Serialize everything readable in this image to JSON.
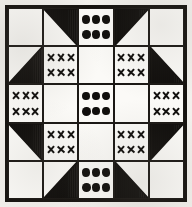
{
  "figure": {
    "kind": "quilt-block-diagram",
    "title": "",
    "grid_rows": 5,
    "grid_cols": 5,
    "colors": {
      "ink": "#100e0c",
      "paper": "#fbfaf7",
      "frame": "#15120f",
      "background": "#f2f0ec"
    },
    "motif_counts": {
      "dots_per_cell": 6,
      "crosses_per_cell": 6,
      "dot_grid": "3x2",
      "cross_grid": "3x2"
    },
    "legend": {
      "plain": "plain / unprinted patch",
      "hatched": "striped (vertical-line) triangle patch",
      "dots": "dotted print patch",
      "crosses": "cross / X print patch"
    },
    "cells": [
      {
        "row": 1,
        "col": 1,
        "type": "plain",
        "name": "corner-top-left",
        "count": 0,
        "corner": ""
      },
      {
        "row": 1,
        "col": 2,
        "type": "hatched",
        "name": "star-point-top-left",
        "count": 0,
        "corner": "bottom-right"
      },
      {
        "row": 1,
        "col": 3,
        "type": "dots",
        "name": "dot-patch-top-center",
        "count": 6,
        "corner": ""
      },
      {
        "row": 1,
        "col": 4,
        "type": "hatched",
        "name": "star-point-top-right",
        "count": 0,
        "corner": "bottom-left"
      },
      {
        "row": 1,
        "col": 5,
        "type": "plain",
        "name": "corner-top-right",
        "count": 0,
        "corner": ""
      },
      {
        "row": 2,
        "col": 1,
        "type": "hatched",
        "name": "star-point-left-top",
        "count": 0,
        "corner": "top-right"
      },
      {
        "row": 2,
        "col": 2,
        "type": "crosses",
        "name": "cross-patch-upper-left",
        "count": 6,
        "corner": ""
      },
      {
        "row": 2,
        "col": 3,
        "type": "plain",
        "name": "plain-top-center-inner",
        "count": 0,
        "corner": ""
      },
      {
        "row": 2,
        "col": 4,
        "type": "crosses",
        "name": "cross-patch-upper-right",
        "count": 6,
        "corner": ""
      },
      {
        "row": 2,
        "col": 5,
        "type": "hatched",
        "name": "star-point-right-top",
        "count": 0,
        "corner": "top-left"
      },
      {
        "row": 3,
        "col": 1,
        "type": "crosses",
        "name": "cross-patch-mid-left",
        "count": 6,
        "corner": ""
      },
      {
        "row": 3,
        "col": 2,
        "type": "plain",
        "name": "plain-mid-left-inner",
        "count": 0,
        "corner": ""
      },
      {
        "row": 3,
        "col": 3,
        "type": "dots",
        "name": "dot-patch-center",
        "count": 6,
        "corner": ""
      },
      {
        "row": 3,
        "col": 4,
        "type": "plain",
        "name": "plain-mid-right-inner",
        "count": 0,
        "corner": ""
      },
      {
        "row": 3,
        "col": 5,
        "type": "crosses",
        "name": "cross-patch-mid-right",
        "count": 6,
        "corner": ""
      },
      {
        "row": 4,
        "col": 1,
        "type": "hatched",
        "name": "star-point-left-bottom",
        "count": 0,
        "corner": "bottom-right"
      },
      {
        "row": 4,
        "col": 2,
        "type": "crosses",
        "name": "cross-patch-lower-left",
        "count": 6,
        "corner": ""
      },
      {
        "row": 4,
        "col": 3,
        "type": "plain",
        "name": "plain-bottom-center-inner",
        "count": 0,
        "corner": ""
      },
      {
        "row": 4,
        "col": 4,
        "type": "crosses",
        "name": "cross-patch-lower-right",
        "count": 6,
        "corner": ""
      },
      {
        "row": 4,
        "col": 5,
        "type": "hatched",
        "name": "star-point-right-bottom",
        "count": 0,
        "corner": "bottom-left"
      },
      {
        "row": 5,
        "col": 1,
        "type": "plain",
        "name": "corner-bottom-left",
        "count": 0,
        "corner": ""
      },
      {
        "row": 5,
        "col": 2,
        "type": "hatched",
        "name": "star-point-bottom-left",
        "count": 0,
        "corner": "top-right"
      },
      {
        "row": 5,
        "col": 3,
        "type": "dots",
        "name": "dot-patch-bottom-center",
        "count": 6,
        "corner": ""
      },
      {
        "row": 5,
        "col": 4,
        "type": "hatched",
        "name": "star-point-bottom-right",
        "count": 0,
        "corner": "top-left"
      },
      {
        "row": 5,
        "col": 5,
        "type": "plain",
        "name": "corner-bottom-right",
        "count": 0,
        "corner": ""
      }
    ]
  }
}
